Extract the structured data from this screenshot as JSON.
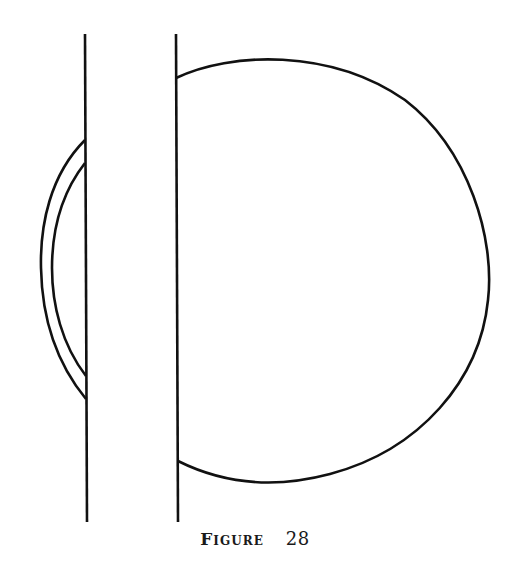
{
  "figure": {
    "caption_word": "Figure",
    "caption_number": "28",
    "stroke_color": "#111111",
    "background": "#ffffff"
  },
  "elements": {
    "left_wall": {
      "x1": 85,
      "y1": 34,
      "x2": 87,
      "y2": 522
    },
    "right_wall": {
      "x1": 176,
      "y1": 34,
      "x2": 178,
      "y2": 522
    },
    "large_arc": {
      "start": [
        176,
        78
      ],
      "end": [
        178,
        461
      ],
      "rightmost_x": 489,
      "top_y": 58,
      "bottom_y": 480
    },
    "outer_small_arc": {
      "start": [
        85,
        140
      ],
      "end": [
        86,
        399
      ],
      "leftmost_x": 41
    },
    "inner_small_arc": {
      "start": [
        85,
        163
      ],
      "end": [
        86,
        376
      ],
      "leftmost_x": 52
    }
  }
}
